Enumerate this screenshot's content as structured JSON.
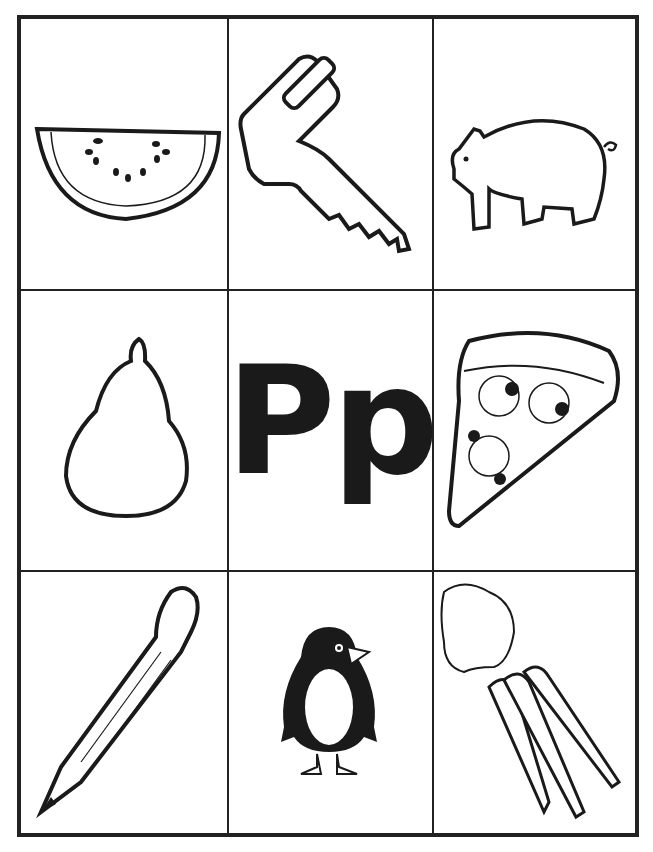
{
  "worksheet": {
    "letter_display": "Pp",
    "letter": "P",
    "grid": {
      "rows": 3,
      "cols": 3
    },
    "pictures": [
      {
        "row": 0,
        "col": 0,
        "name": "watermelon",
        "label": "watermelon slice"
      },
      {
        "row": 0,
        "col": 1,
        "name": "key",
        "label": "key"
      },
      {
        "row": 0,
        "col": 2,
        "name": "pig",
        "label": "pig"
      },
      {
        "row": 1,
        "col": 0,
        "name": "pear",
        "label": "pear"
      },
      {
        "row": 1,
        "col": 1,
        "name": "letter",
        "label": "Pp"
      },
      {
        "row": 1,
        "col": 2,
        "name": "pizza",
        "label": "pizza slice"
      },
      {
        "row": 2,
        "col": 0,
        "name": "pencil",
        "label": "pencil"
      },
      {
        "row": 2,
        "col": 1,
        "name": "penguin",
        "label": "penguin"
      },
      {
        "row": 2,
        "col": 2,
        "name": "carrots",
        "label": "carrots"
      }
    ],
    "colors": {
      "line": "#222222",
      "background": "#ffffff"
    }
  }
}
